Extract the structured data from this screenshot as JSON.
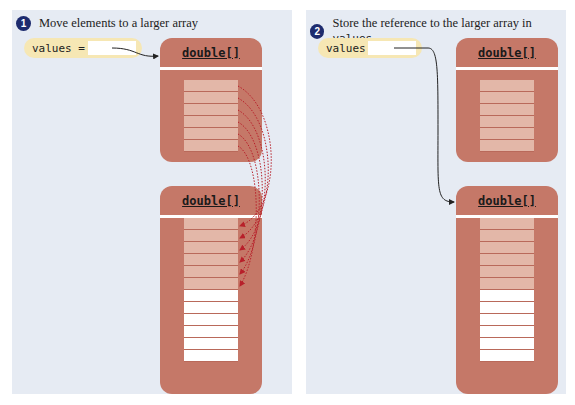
{
  "steps": [
    {
      "number": "1",
      "caption": "Move elements to a larger array",
      "caption_code": ""
    },
    {
      "number": "2",
      "caption": "Store the reference to the larger array in ",
      "caption_code": "values"
    }
  ],
  "variable": {
    "label": "values ="
  },
  "array_type": "double[]",
  "small_array": {
    "filled": 6,
    "empty": 0
  },
  "large_array": {
    "filled": 6,
    "empty": 6
  },
  "colors": {
    "panel": "#e6ebf3",
    "array": "#c57868",
    "filled_cell": "#e3b7a8",
    "empty_cell": "#ffffff",
    "variable": "#f6e7b4",
    "step_badge": "#1d2b6e",
    "copy_arrow": "#b8202a"
  }
}
